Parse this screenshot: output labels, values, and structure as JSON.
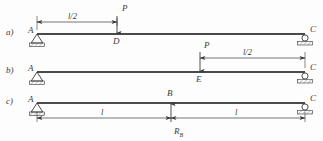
{
  "figure": {
    "type": "structural-beam-diagram",
    "background_color": "#fdfdfd",
    "line_color": "#3a3a3a",
    "beam_color": "#4a4a4a",
    "rows": [
      {
        "id": "a",
        "row_label": "a)",
        "beam_y": 34,
        "span_start_x": 37,
        "span_end_x": 305,
        "left_support": {
          "type": "pin",
          "node": "A",
          "label": "A"
        },
        "right_support": {
          "type": "roller",
          "node": "C",
          "label": "C"
        },
        "load": {
          "label": "P",
          "direction": "down",
          "node_label": "D",
          "x": 117
        },
        "dimension": {
          "label": "l/2",
          "from_x": 37,
          "to_x": 117,
          "y": 22
        }
      },
      {
        "id": "b",
        "row_label": "b)",
        "beam_y": 72,
        "span_start_x": 37,
        "span_end_x": 305,
        "left_support": {
          "type": "pin",
          "node": "A",
          "label": "A"
        },
        "right_support": {
          "type": "roller",
          "node": "C",
          "label": "C"
        },
        "load": {
          "label": "P",
          "direction": "down",
          "node_label": "E",
          "x": 200
        },
        "dimension": {
          "label": "l/2",
          "from_x": 200,
          "to_x": 305,
          "y": 58
        }
      },
      {
        "id": "c",
        "row_label": "c)",
        "beam_y": 103,
        "span_start_x": 37,
        "span_end_x": 305,
        "left_support": {
          "type": "pin",
          "node": "A",
          "label": "A"
        },
        "right_support": {
          "type": "roller",
          "node": "C",
          "label": "C"
        },
        "reaction": {
          "label": "R",
          "subscript": "B",
          "direction": "up",
          "node_label": "B",
          "x": 171
        },
        "dimensions": [
          {
            "label": "l",
            "from_x": 37,
            "to_x": 171,
            "y": 118
          },
          {
            "label": "l",
            "from_x": 171,
            "to_x": 305,
            "y": 118
          }
        ]
      }
    ],
    "labels": {
      "row_a": "a)",
      "row_b": "b)",
      "row_c": "c)",
      "node_A": "A",
      "node_B": "B",
      "node_C": "C",
      "node_D": "D",
      "node_E": "E",
      "force_P": "P",
      "reaction_R": "R",
      "reaction_sub": "B",
      "dim_half": "l/2",
      "dim_full": "l"
    }
  }
}
